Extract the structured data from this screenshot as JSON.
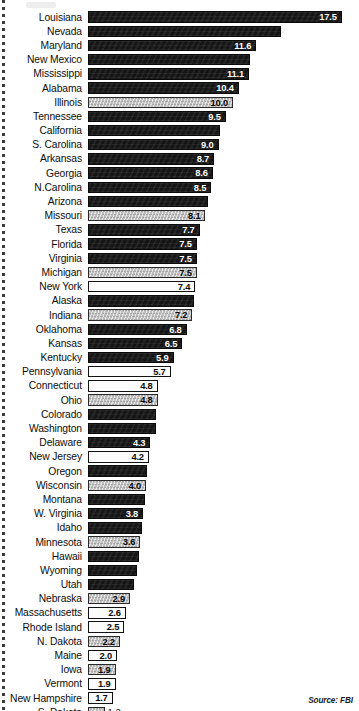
{
  "source_note": "Source: FBI",
  "axis": {
    "bar_origin_px": 95,
    "px_per_unit": 14.5,
    "row_pitch_px": 14.2
  },
  "chart_data": {
    "type": "bar",
    "orientation": "horizontal",
    "title": "",
    "subtitle": "",
    "xlabel": "",
    "ylabel": "",
    "xlim": [
      0,
      17.5
    ],
    "grid": false,
    "legend": "none",
    "annotations": [
      "Source: FBI"
    ],
    "categories": [
      "Louisiana",
      "Nevada",
      "Maryland",
      "New Mexico",
      "Mississippi",
      "Alabama",
      "Illinois",
      "Tennessee",
      "California",
      "S. Carolina",
      "Arkansas",
      "Georgia",
      "N.Carolina",
      "Arizona",
      "Missouri",
      "Texas",
      "Florida",
      "Virginia",
      "Michigan",
      "New York",
      "Alaska",
      "Indiana",
      "Oklahoma",
      "Kansas",
      "Kentucky",
      "Pennsylvania",
      "Connecticut",
      "Ohio",
      "Colorado",
      "Washington",
      "Delaware",
      "New Jersey",
      "Oregon",
      "Wisconsin",
      "Montana",
      "W. Virginia",
      "Idaho",
      "Minnesota",
      "Hawaii",
      "Wyoming",
      "Utah",
      "Nebraska",
      "Massachusetts",
      "Rhode Island",
      "N. Dakota",
      "Maine",
      "Iowa",
      "Vermont",
      "New Hampshire",
      "S. Dakota"
    ],
    "values": [
      17.5,
      13.3,
      11.6,
      11.2,
      11.1,
      10.4,
      10.0,
      9.5,
      9.1,
      9.0,
      8.7,
      8.6,
      8.5,
      8.3,
      8.1,
      7.7,
      7.5,
      7.5,
      7.5,
      7.4,
      7.3,
      7.2,
      6.8,
      6.5,
      5.9,
      5.7,
      4.8,
      4.8,
      4.7,
      4.7,
      4.3,
      4.2,
      4.1,
      4.0,
      3.9,
      3.8,
      3.7,
      3.6,
      3.5,
      3.4,
      3.2,
      2.9,
      2.6,
      2.5,
      2.2,
      2.0,
      1.9,
      1.9,
      1.7,
      1.2
    ]
  },
  "bars": [
    {
      "label": "Louisiana",
      "value": 17.5,
      "display": "17.5",
      "fill": "dark",
      "label_inside": true
    },
    {
      "label": "Nevada",
      "value": 13.3,
      "display": "",
      "fill": "dark",
      "label_inside": true
    },
    {
      "label": "Maryland",
      "value": 11.6,
      "display": "11.6",
      "fill": "dark",
      "label_inside": true
    },
    {
      "label": "New Mexico",
      "value": 11.2,
      "display": "",
      "fill": "dark",
      "label_inside": true
    },
    {
      "label": "Mississippi",
      "value": 11.1,
      "display": "11.1",
      "fill": "dark",
      "label_inside": true
    },
    {
      "label": "Alabama",
      "value": 10.4,
      "display": "10.4",
      "fill": "dark",
      "label_inside": true
    },
    {
      "label": "Illinois",
      "value": 10.0,
      "display": "10.0",
      "fill": "gray",
      "label_inside": true
    },
    {
      "label": "Tennessee",
      "value": 9.5,
      "display": "9.5",
      "fill": "dark",
      "label_inside": true
    },
    {
      "label": "California",
      "value": 9.1,
      "display": "",
      "fill": "dark",
      "label_inside": true
    },
    {
      "label": "S. Carolina",
      "value": 9.0,
      "display": "9.0",
      "fill": "dark",
      "label_inside": true
    },
    {
      "label": "Arkansas",
      "value": 8.7,
      "display": "8.7",
      "fill": "dark",
      "label_inside": true
    },
    {
      "label": "Georgia",
      "value": 8.6,
      "display": "8.6",
      "fill": "dark",
      "label_inside": true
    },
    {
      "label": "N.Carolina",
      "value": 8.5,
      "display": "8.5",
      "fill": "dark",
      "label_inside": true
    },
    {
      "label": "Arizona",
      "value": 8.3,
      "display": "",
      "fill": "dark",
      "label_inside": true
    },
    {
      "label": "Missouri",
      "value": 8.1,
      "display": "8.1",
      "fill": "gray",
      "label_inside": true
    },
    {
      "label": "Texas",
      "value": 7.7,
      "display": "7.7",
      "fill": "dark",
      "label_inside": true
    },
    {
      "label": "Florida",
      "value": 7.5,
      "display": "7.5",
      "fill": "dark",
      "label_inside": true
    },
    {
      "label": "Virginia",
      "value": 7.5,
      "display": "7.5",
      "fill": "dark",
      "label_inside": true
    },
    {
      "label": "Michigan",
      "value": 7.5,
      "display": "7.5",
      "fill": "gray",
      "label_inside": true
    },
    {
      "label": "New York",
      "value": 7.4,
      "display": "7.4",
      "fill": "white",
      "label_inside": true
    },
    {
      "label": "Alaska",
      "value": 7.3,
      "display": "",
      "fill": "dark",
      "label_inside": true
    },
    {
      "label": "Indiana",
      "value": 7.2,
      "display": "7.2",
      "fill": "gray",
      "label_inside": true
    },
    {
      "label": "Oklahoma",
      "value": 6.8,
      "display": "6.8",
      "fill": "dark",
      "label_inside": true
    },
    {
      "label": "Kansas",
      "value": 6.5,
      "display": "6.5",
      "fill": "dark",
      "label_inside": true
    },
    {
      "label": "Kentucky",
      "value": 5.9,
      "display": "5.9",
      "fill": "dark",
      "label_inside": true
    },
    {
      "label": "Pennsylvania",
      "value": 5.7,
      "display": "5.7",
      "fill": "white",
      "label_inside": true
    },
    {
      "label": "Connecticut",
      "value": 4.8,
      "display": "4.8",
      "fill": "white",
      "label_inside": true
    },
    {
      "label": "Ohio",
      "value": 4.8,
      "display": "4.8",
      "fill": "gray",
      "label_inside": true
    },
    {
      "label": "Colorado",
      "value": 4.7,
      "display": "",
      "fill": "dark",
      "label_inside": true
    },
    {
      "label": "Washington",
      "value": 4.7,
      "display": "",
      "fill": "dark",
      "label_inside": true
    },
    {
      "label": "Delaware",
      "value": 4.3,
      "display": "4.3",
      "fill": "dark",
      "label_inside": true
    },
    {
      "label": "New Jersey",
      "value": 4.2,
      "display": "4.2",
      "fill": "white",
      "label_inside": true
    },
    {
      "label": "Oregon",
      "value": 4.1,
      "display": "",
      "fill": "dark",
      "label_inside": true
    },
    {
      "label": "Wisconsin",
      "value": 4.0,
      "display": "4.0",
      "fill": "gray",
      "label_inside": true
    },
    {
      "label": "Montana",
      "value": 3.9,
      "display": "",
      "fill": "dark",
      "label_inside": true
    },
    {
      "label": "W. Virginia",
      "value": 3.8,
      "display": "3.8",
      "fill": "dark",
      "label_inside": true
    },
    {
      "label": "Idaho",
      "value": 3.7,
      "display": "",
      "fill": "dark",
      "label_inside": true
    },
    {
      "label": "Minnesota",
      "value": 3.6,
      "display": "3.6",
      "fill": "gray",
      "label_inside": true
    },
    {
      "label": "Hawaii",
      "value": 3.5,
      "display": "",
      "fill": "dark",
      "label_inside": true
    },
    {
      "label": "Wyoming",
      "value": 3.4,
      "display": "",
      "fill": "dark",
      "label_inside": true
    },
    {
      "label": "Utah",
      "value": 3.2,
      "display": "",
      "fill": "dark",
      "label_inside": true
    },
    {
      "label": "Nebraska",
      "value": 2.9,
      "display": "2.9",
      "fill": "gray",
      "label_inside": true
    },
    {
      "label": "Massachusetts",
      "value": 2.6,
      "display": "2.6",
      "fill": "white",
      "label_inside": true
    },
    {
      "label": "Rhode Island",
      "value": 2.5,
      "display": "2.5",
      "fill": "white",
      "label_inside": true
    },
    {
      "label": "N. Dakota",
      "value": 2.2,
      "display": "2.2",
      "fill": "gray",
      "label_inside": true
    },
    {
      "label": "Maine",
      "value": 2.0,
      "display": "2.0",
      "fill": "white",
      "label_inside": true
    },
    {
      "label": "Iowa",
      "value": 1.9,
      "display": "1.9",
      "fill": "gray",
      "label_inside": true
    },
    {
      "label": "Vermont",
      "value": 1.9,
      "display": "1.9",
      "fill": "white",
      "label_inside": true
    },
    {
      "label": "New Hampshire",
      "value": 1.7,
      "display": "1.7",
      "fill": "white",
      "label_inside": true
    },
    {
      "label": "S. Dakota",
      "value": 1.2,
      "display": "1.2",
      "fill": "gray",
      "label_inside": false
    }
  ]
}
